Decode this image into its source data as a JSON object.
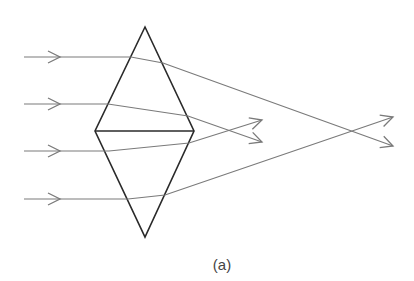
{
  "figure": {
    "caption": "(a)",
    "colors": {
      "prism_stroke": "#2a2a2a",
      "ray_stroke": "#7a7a7a",
      "caption_text": "#444444",
      "background": "#ffffff"
    },
    "prism": {
      "top_apex": [
        145,
        27
      ],
      "left_corner": [
        95,
        131
      ],
      "right_corner": [
        194,
        131
      ],
      "bottom_apex": [
        145,
        237
      ]
    },
    "rays": [
      {
        "id": "ray-1",
        "incident_y": 57,
        "start": [
          24,
          57
        ],
        "entry": [
          131,
          57
        ],
        "exit": [
          163,
          63
        ],
        "end": [
          393,
          146
        ],
        "arrow_in_x": 60
      },
      {
        "id": "ray-2",
        "incident_y": 104,
        "start": [
          24,
          104
        ],
        "entry": [
          108,
          104
        ],
        "exit": [
          188,
          116
        ],
        "end": [
          262,
          142
        ],
        "arrow_in_x": 60
      },
      {
        "id": "ray-3",
        "incident_y": 151,
        "start": [
          24,
          151
        ],
        "entry": [
          109,
          151
        ],
        "exit": [
          189,
          143
        ],
        "end": [
          262,
          120
        ],
        "arrow_in_x": 60
      },
      {
        "id": "ray-4",
        "incident_y": 199,
        "start": [
          24,
          199
        ],
        "entry": [
          128,
          199
        ],
        "exit": [
          165,
          195
        ],
        "end": [
          393,
          117
        ],
        "arrow_in_x": 60
      }
    ],
    "focal_points": [
      {
        "name": "near-focus",
        "point": [
          230,
          131
        ],
        "rays": [
          "ray-2",
          "ray-3"
        ]
      },
      {
        "name": "far-focus",
        "point": [
          352,
          131
        ],
        "rays": [
          "ray-1",
          "ray-4"
        ]
      }
    ]
  }
}
